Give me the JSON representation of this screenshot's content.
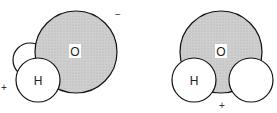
{
  "diagram": {
    "left_molecule": {
      "oxygen_label": "O",
      "hydrogen_label": "H",
      "positive_sign": "+",
      "negative_sign": "−"
    },
    "right_molecule": {
      "oxygen_label": "O",
      "hydrogen_label": "H",
      "positive_sign": "+"
    },
    "colors": {
      "oxygen_fill": "#c8c8c8",
      "hydrogen_fill": "#ffffff",
      "stroke": "#111111"
    }
  }
}
